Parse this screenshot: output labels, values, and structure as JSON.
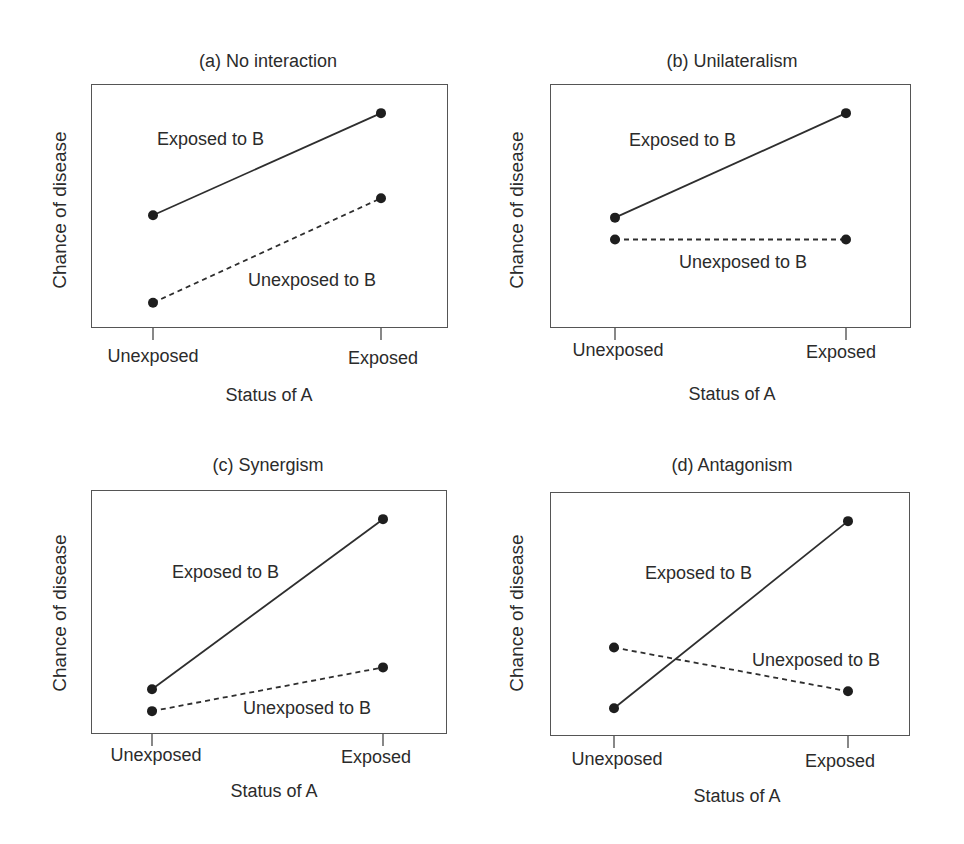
{
  "chart_data": [
    {
      "type": "line",
      "title": "(a) No interaction",
      "xlabel": "Status of A",
      "ylabel": "Chance of disease",
      "categories": [
        "Unexposed",
        "Exposed"
      ],
      "series": [
        {
          "name": "Exposed to B",
          "style": "solid",
          "values": [
            46,
            88
          ]
        },
        {
          "name": "Unexposed to B",
          "style": "dashed",
          "values": [
            10,
            53
          ]
        }
      ],
      "ylim": [
        0,
        100
      ],
      "grid": false,
      "legend": "inline labels"
    },
    {
      "type": "line",
      "title": "(b) Unilateralism",
      "xlabel": "Status of A",
      "ylabel": "Chance of disease",
      "categories": [
        "Unexposed",
        "Exposed"
      ],
      "series": [
        {
          "name": "Exposed to B",
          "style": "solid",
          "values": [
            45,
            88
          ]
        },
        {
          "name": "Unexposed to B",
          "style": "dashed",
          "values": [
            36,
            36
          ]
        }
      ],
      "ylim": [
        0,
        100
      ],
      "grid": false,
      "legend": "inline labels"
    },
    {
      "type": "line",
      "title": "(c) Synergism",
      "xlabel": "Status of A",
      "ylabel": "Chance of disease",
      "categories": [
        "Unexposed",
        "Exposed"
      ],
      "series": [
        {
          "name": "Exposed to B",
          "style": "solid",
          "values": [
            18,
            88
          ]
        },
        {
          "name": "Unexposed to B",
          "style": "dashed",
          "values": [
            9,
            27
          ]
        }
      ],
      "ylim": [
        0,
        100
      ],
      "grid": false,
      "legend": "inline labels"
    },
    {
      "type": "line",
      "title": "(d) Antagonism",
      "xlabel": "Status of A",
      "ylabel": "Chance of disease",
      "categories": [
        "Unexposed",
        "Exposed"
      ],
      "series": [
        {
          "name": "Exposed to B",
          "style": "solid",
          "values": [
            11,
            88
          ]
        },
        {
          "name": "Unexposed to B",
          "style": "dashed",
          "values": [
            36,
            18
          ]
        }
      ],
      "ylim": [
        0,
        100
      ],
      "grid": false,
      "legend": "inline labels"
    }
  ],
  "panels": [
    {
      "title": "(a) No interaction",
      "ylabel": "Chance of disease",
      "xlabel": "Status of A",
      "ticks": [
        "Unexposed",
        "Exposed"
      ],
      "labels": {
        "exposed": "Exposed to B",
        "unexposed": "Unexposed to B"
      }
    },
    {
      "title": "(b) Unilateralism",
      "ylabel": "Chance of disease",
      "xlabel": "Status of A",
      "ticks": [
        "Unexposed",
        "Exposed"
      ],
      "labels": {
        "exposed": "Exposed to B",
        "unexposed": "Unexposed to B"
      }
    },
    {
      "title": "(c) Synergism",
      "ylabel": "Chance of disease",
      "xlabel": "Status of A",
      "ticks": [
        "Unexposed",
        "Exposed"
      ],
      "labels": {
        "exposed": "Exposed to B",
        "unexposed": "Unexposed to B"
      }
    },
    {
      "title": "(d) Antagonism",
      "ylabel": "Chance of disease",
      "xlabel": "Status of A",
      "ticks": [
        "Unexposed",
        "Exposed"
      ],
      "labels": {
        "exposed": "Exposed to B",
        "unexposed": "Unexposed to B"
      }
    }
  ],
  "colors": {
    "line": "#2e2e2e",
    "frame": "#555555",
    "text": "#2b2b2b"
  }
}
